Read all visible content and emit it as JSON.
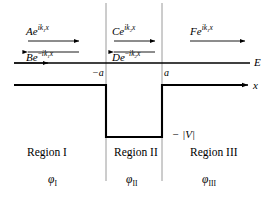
{
  "figure": {
    "colors": {
      "ink": "#000000",
      "paper": "#ffffff",
      "divider": "#808080"
    }
  },
  "waves": {
    "region1_right": {
      "coef": "A",
      "exp_sign": "",
      "k": "1",
      "base": "e",
      "var": "x",
      "direction": "right"
    },
    "region1_left": {
      "coef": "B",
      "exp_sign": "−",
      "k": "1",
      "base": "e",
      "var": "x",
      "direction": "left"
    },
    "region2_right": {
      "coef": "C",
      "exp_sign": "",
      "k": "2",
      "base": "e",
      "var": "x",
      "direction": "right"
    },
    "region2_left": {
      "coef": "D",
      "exp_sign": "−",
      "k": "2",
      "base": "e",
      "var": "x",
      "direction": "left"
    },
    "region3_right": {
      "coef": "F",
      "exp_sign": "",
      "k": "1",
      "base": "e",
      "var": "x",
      "direction": "right"
    },
    "i_symbol": "i"
  },
  "axes": {
    "energy_label": "E",
    "x_label": "x",
    "tick_left": "−a",
    "tick_right": "a",
    "well_depth_label": "− |V|"
  },
  "regions": [
    {
      "name": "Region I",
      "wavefunction": "φ",
      "subscript": "I"
    },
    {
      "name": "Region II",
      "wavefunction": "φ",
      "subscript": "II"
    },
    {
      "name": "Region III",
      "wavefunction": "φ",
      "subscript": "III"
    }
  ]
}
